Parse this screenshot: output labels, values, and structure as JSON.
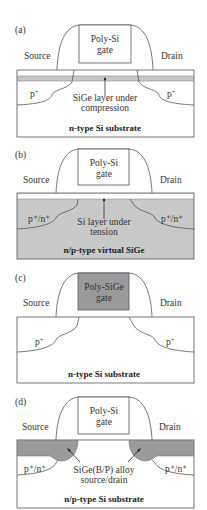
{
  "panels": [
    {
      "id": "(a)",
      "source_label": "Source",
      "drain_label": "Drain",
      "gate_label_line1": "Poly-Si",
      "gate_label_line2": "gate",
      "left_region_label": "p",
      "left_region_sup": "+",
      "right_region_label": "p",
      "right_region_sup": "+",
      "annotation_line1": "SiGe layer under",
      "annotation_line2": "compression",
      "substrate_label": "n-type Si substrate"
    },
    {
      "id": "(b)",
      "source_label": "Source",
      "drain_label": "Drain",
      "gate_label_line1": "Poly-Si",
      "gate_label_line2": "gate",
      "left_region_label": "p⁺/n⁺",
      "right_region_label": "p⁺/n⁺",
      "annotation_line1": "Si layer under",
      "annotation_line2": "tension",
      "substrate_label": "n/p-type virtual SiGe"
    },
    {
      "id": "(c)",
      "source_label": "Source",
      "drain_label": "Drain",
      "gate_label_line1": "Poly-SiGe",
      "gate_label_line2": "gate",
      "left_region_label": "p",
      "left_region_sup": "+",
      "right_region_label": "p",
      "right_region_sup": "+",
      "substrate_label": "n-type Si substrate"
    },
    {
      "id": "(d)",
      "source_label": "Source",
      "drain_label": "Drain",
      "gate_label_line1": "Poly-Si",
      "gate_label_line2": "gate",
      "left_region_label": "p⁺/n⁺",
      "right_region_label": "p⁺/n⁺",
      "annotation_line1": "SiGe(B/P) alloy",
      "annotation_line2": "source/drain",
      "substrate_label": "n/p-type Si substrate"
    }
  ],
  "colors": {
    "sige_grey": "#c8c8c8",
    "dark_grey": "#9a9a9a",
    "outline": "#555555",
    "white": "#ffffff"
  }
}
